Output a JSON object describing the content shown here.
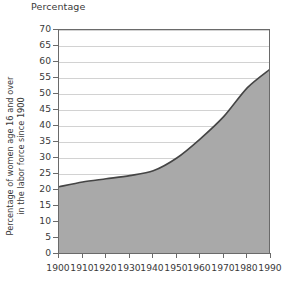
{
  "chart_data": {
    "type": "area",
    "title": "Percentage",
    "xlabel": "",
    "ylabel": "Percentage of women age 16 and over in the labor force since 1900",
    "ylabel_line1": "Percentage of women age 16 and over",
    "ylabel_line2": "in the labor force since 1900",
    "categories": [
      1900,
      1910,
      1920,
      1930,
      1940,
      1950,
      1960,
      1970,
      1980,
      1990
    ],
    "x": [
      1900,
      1910,
      1920,
      1930,
      1940,
      1950,
      1960,
      1970,
      1980,
      1990
    ],
    "values": [
      21,
      22.5,
      23.5,
      24.5,
      26,
      30,
      36,
      43,
      52,
      58
    ],
    "series": [
      {
        "name": "Percentage of women age 16 and over in the labor force",
        "values": [
          21,
          22.5,
          23.5,
          24.5,
          26,
          30,
          36,
          43,
          52,
          58
        ]
      }
    ],
    "xlim": [
      1900,
      1990
    ],
    "ylim": [
      0,
      70
    ],
    "ytick_labels": [
      "0",
      "5",
      "10",
      "15",
      "20",
      "25",
      "30",
      "35",
      "40",
      "45",
      "50",
      "55",
      "60",
      "65",
      "70"
    ],
    "ytick_values": [
      0,
      5,
      10,
      15,
      20,
      25,
      30,
      35,
      40,
      45,
      50,
      55,
      60,
      65,
      70
    ],
    "xtick_labels": [
      "1900",
      "1910",
      "1920",
      "1930",
      "1940",
      "1950",
      "1960",
      "1970",
      "1980",
      "1990"
    ],
    "xtick_values": [
      1900,
      1910,
      1920,
      1930,
      1940,
      1950,
      1960,
      1970,
      1980,
      1990
    ],
    "grid": true,
    "grid_axis": "y",
    "legend": false,
    "legend_position": "none",
    "annotations": [],
    "colors": {
      "area_fill": "#a9a9a9",
      "area_line": "#454545",
      "gridline": "#d2d2d2",
      "axis": "#6a6a6a",
      "text": "#3a3a3a",
      "background": "#ffffff"
    }
  }
}
